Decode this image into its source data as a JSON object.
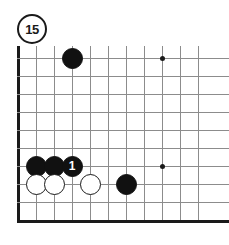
{
  "diagram": {
    "label": "15",
    "type": "go-board-problem",
    "board": {
      "origin_x": 18,
      "origin_y": 58,
      "spacing": 18,
      "cols": 11,
      "rows": 10,
      "edges": [
        "left",
        "bottom"
      ],
      "line_color": "#8c8c8c",
      "edge_color": "#1a1a1a"
    },
    "star_points": [
      {
        "col": 8,
        "row": 0
      },
      {
        "col": 8,
        "row": 6
      }
    ],
    "stones": [
      {
        "col": 3,
        "row": 0,
        "color": "black",
        "label": ""
      },
      {
        "col": 1,
        "row": 6,
        "color": "black",
        "label": ""
      },
      {
        "col": 2,
        "row": 6,
        "color": "black",
        "label": ""
      },
      {
        "col": 3,
        "row": 6,
        "color": "black",
        "label": "1"
      },
      {
        "col": 1,
        "row": 7,
        "color": "white",
        "label": ""
      },
      {
        "col": 2,
        "row": 7,
        "color": "white",
        "label": ""
      },
      {
        "col": 4,
        "row": 7,
        "color": "white",
        "label": ""
      },
      {
        "col": 6,
        "row": 7,
        "color": "black",
        "label": ""
      }
    ]
  }
}
